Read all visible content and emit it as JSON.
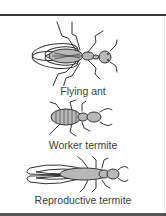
{
  "figure": {
    "insects": [
      {
        "id": "flying-ant",
        "label": "Flying ant"
      },
      {
        "id": "worker-termite",
        "label": "Worker termite"
      },
      {
        "id": "reproductive-termite",
        "label": "Reproductive termite"
      }
    ]
  },
  "colors": {
    "line": "#3a3a3a",
    "body_fill": "#b8b8b8",
    "text": "#3c3c3c",
    "background": "#ffffff"
  }
}
